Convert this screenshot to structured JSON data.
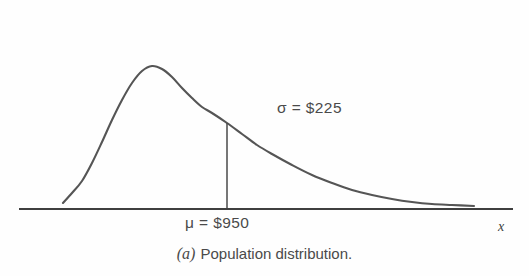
{
  "figure": {
    "caption_index": "(a)",
    "caption_text": "Population distribution.",
    "background_color": "#fefefe",
    "curve_color": "#555555",
    "axis_color": "#3f3f3f",
    "text_color": "#4a4a4a"
  },
  "labels": {
    "sigma": "σ = $225",
    "mu": "μ = $950",
    "x_axis": "x"
  },
  "chart_data": {
    "type": "line",
    "title": "",
    "subtitle": "",
    "xlabel": "x",
    "ylabel": "",
    "grid": false,
    "legend": "none",
    "distribution": "right-skewed population distribution",
    "annotations": [
      {
        "name": "mean",
        "symbol": "μ",
        "label": "μ = $950",
        "value": 950,
        "currency": "$",
        "marker": "vertical-line-at-mean"
      },
      {
        "name": "standard-deviation",
        "symbol": "σ",
        "label": "σ = $225",
        "value": 225,
        "currency": "$"
      }
    ],
    "curve_points_px": [
      [
        63,
        203
      ],
      [
        72,
        193
      ],
      [
        82,
        181
      ],
      [
        92,
        163
      ],
      [
        102,
        142
      ],
      [
        112,
        120
      ],
      [
        122,
        100
      ],
      [
        132,
        83
      ],
      [
        142,
        71
      ],
      [
        152,
        66
      ],
      [
        162,
        69
      ],
      [
        172,
        77
      ],
      [
        182,
        88
      ],
      [
        192,
        98
      ],
      [
        202,
        107
      ],
      [
        212,
        113
      ],
      [
        227,
        123
      ],
      [
        242,
        134
      ],
      [
        257,
        145
      ],
      [
        272,
        154
      ],
      [
        292,
        165
      ],
      [
        312,
        175
      ],
      [
        332,
        183
      ],
      [
        352,
        190
      ],
      [
        372,
        195
      ],
      [
        392,
        199
      ],
      [
        412,
        202
      ],
      [
        432,
        204
      ],
      [
        452,
        205
      ],
      [
        474,
        206
      ]
    ],
    "axis_line_px": {
      "x1": 20,
      "y1": 209,
      "x2": 512,
      "y2": 209
    },
    "mean_line_px": {
      "x": 227,
      "y_top": 123,
      "y_bottom": 209
    },
    "peak_px": {
      "x": 152,
      "y": 66
    }
  }
}
